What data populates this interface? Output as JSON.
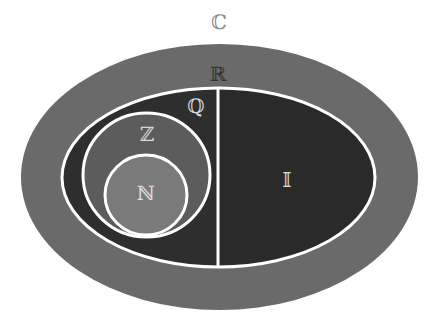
{
  "diagram": {
    "type": "nested-set-venn",
    "sets": {
      "complex": {
        "label": "ℂ",
        "name": "Complex numbers"
      },
      "real": {
        "label": "ℝ",
        "name": "Real numbers"
      },
      "rational": {
        "label": "ℚ",
        "name": "Rational numbers"
      },
      "irrational": {
        "label": "𝕀",
        "name": "Irrational numbers"
      },
      "integer": {
        "label": "ℤ",
        "name": "Integers"
      },
      "natural": {
        "label": "ℕ",
        "name": "Natural numbers"
      }
    },
    "colors": {
      "background": "#ffffff",
      "real_band": "#6a6a6a",
      "rational_fill": "#2e2e2e",
      "irrational_fill": "#2a2a2a",
      "integer_fill": "#5c5c5c",
      "natural_fill": "#7a7a7a",
      "outline": "#ffffff",
      "label_complex": "#8a8a8a",
      "label_real": "#333333",
      "label_light": "#d8d8d8"
    }
  }
}
